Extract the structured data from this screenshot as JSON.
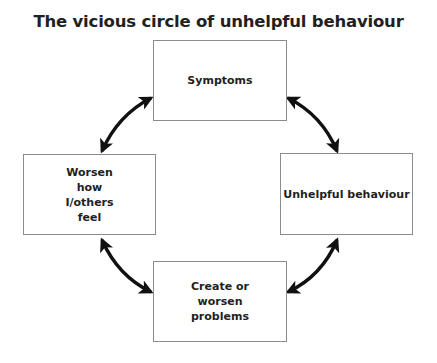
{
  "title": "The vicious circle of unhelpful behaviour",
  "nodes": {
    "top": {
      "label": "Symptoms"
    },
    "right": {
      "label": "Unhelpful behaviour"
    },
    "bottom": {
      "label": "Create or worsen problems"
    },
    "left": {
      "label": "Worsen how I/others feel"
    }
  },
  "edges": [
    {
      "from": "Symptoms",
      "to": "Unhelpful behaviour",
      "type": "bidirectional"
    },
    {
      "from": "Unhelpful behaviour",
      "to": "Create or worsen problems",
      "type": "bidirectional"
    },
    {
      "from": "Create or worsen problems",
      "to": "Worsen how I/others feel",
      "type": "bidirectional"
    },
    {
      "from": "Worsen how I/others feel",
      "to": "Symptoms",
      "type": "bidirectional"
    }
  ],
  "colors": {
    "text": "#231f20",
    "border": "#8c8c8c",
    "arrow": "#111111"
  }
}
